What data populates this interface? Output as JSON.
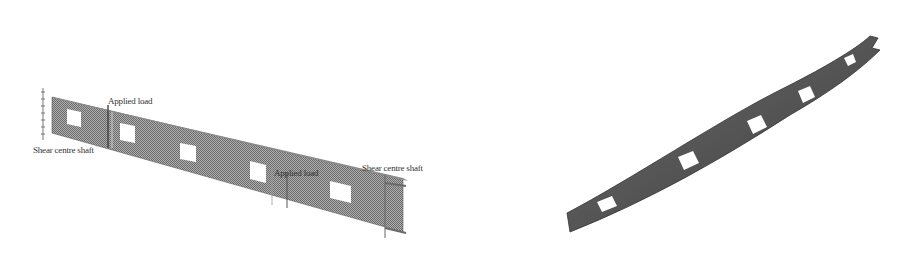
{
  "left_figure": {
    "description": "Straight beam with rectangular web openings, loaded between shear centre shafts",
    "labels": {
      "applied_load_1": "Applied load",
      "applied_load_2": "Applied load",
      "shear_centre_shaft_1": "Shear centre shaft",
      "shear_centre_shaft_2": "Shear centre shaft"
    },
    "openings_count": 5
  },
  "right_figure": {
    "description": "Deformed (twisted) beam with rectangular web openings",
    "openings_count": 5
  },
  "colors": {
    "beam_fill": "#8a8a8a",
    "beam_dark": "#4a4a4a",
    "opening": "#ffffff",
    "background": "#ffffff"
  }
}
